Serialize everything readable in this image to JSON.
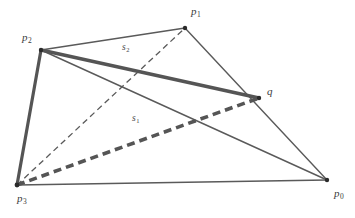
{
  "figure": {
    "type": "geometric-diagram",
    "background_color": "#ffffff",
    "stroke_color": "#5a5a5a",
    "thick_stroke_color": "#555555",
    "vertex_color": "#2b2b2b",
    "width": 355,
    "height": 218
  },
  "points": [
    {
      "id": "p0",
      "label": "p",
      "subscript": "0",
      "x": 327,
      "y": 180,
      "label_x": 334,
      "label_y": 188
    },
    {
      "id": "p1",
      "label": "p",
      "subscript": "1",
      "x": 185,
      "y": 28,
      "label_x": 191,
      "label_y": 6
    },
    {
      "id": "p2",
      "label": "p",
      "subscript": "2",
      "x": 41,
      "y": 50,
      "label_x": 22,
      "label_y": 32
    },
    {
      "id": "p3",
      "label": "p",
      "subscript": "3",
      "x": 17,
      "y": 185,
      "label_x": 17,
      "label_y": 193
    },
    {
      "id": "q",
      "label": "q",
      "subscript": "",
      "x": 259,
      "y": 98,
      "label_x": 267,
      "label_y": 86
    }
  ],
  "segments": [
    {
      "id": "edge-p0-p1",
      "from": "p0",
      "to": "p1",
      "style": "solid",
      "weight": "thin",
      "label": ""
    },
    {
      "id": "edge-p1-p2",
      "from": "p1",
      "to": "p2",
      "style": "solid",
      "weight": "thin",
      "label": ""
    },
    {
      "id": "edge-p2-p3",
      "from": "p2",
      "to": "p3",
      "style": "solid",
      "weight": "thick",
      "label": ""
    },
    {
      "id": "edge-p3-p0",
      "from": "p3",
      "to": "p0",
      "style": "solid",
      "weight": "thin",
      "label": ""
    },
    {
      "id": "diagonal-p2-p0",
      "from": "p2",
      "to": "p0",
      "style": "solid",
      "weight": "thin",
      "label": ""
    },
    {
      "id": "diagonal-p3-p1",
      "from": "p3",
      "to": "p1",
      "style": "dashed",
      "weight": "thin",
      "label": ""
    },
    {
      "id": "segment-s2",
      "from": "p2",
      "to": "q",
      "style": "solid",
      "weight": "thick",
      "label": "s",
      "label_subscript": "2"
    },
    {
      "id": "segment-s1",
      "from": "p3",
      "to": "q",
      "style": "dashed",
      "weight": "thick",
      "label": "s",
      "label_subscript": "1"
    }
  ],
  "segment_labels": [
    {
      "id": "label-s2",
      "text": "s",
      "subscript": "2",
      "x": 122,
      "y": 43
    },
    {
      "id": "label-s1",
      "text": "s",
      "subscript": "1",
      "x": 132,
      "y": 114
    }
  ]
}
